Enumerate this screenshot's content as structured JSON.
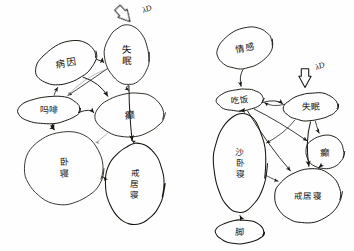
{
  "page": {
    "background_color": "#fefefe",
    "ink_color": "#17150f",
    "faint_ink_color": "#8c8a84",
    "width": 354,
    "height": 251
  },
  "diagrams": [
    {
      "id": "left-diagram",
      "name": "left-network-diagram",
      "node_count": 6,
      "nodes": [
        {
          "id": "L1",
          "name": "node-left-top-left",
          "label": "病因",
          "cx": 66,
          "cy": 63,
          "rx": 31,
          "ry": 20,
          "rotate": -22,
          "font_size": 9.5,
          "stacked": false
        },
        {
          "id": "L2",
          "name": "node-left-top-right",
          "label": "失眠",
          "cx": 127,
          "cy": 55,
          "rx": 22,
          "ry": 30,
          "rotate": -8,
          "font_size": 9.5,
          "stacked": true
        },
        {
          "id": "L3",
          "name": "node-left-middle-left",
          "label": "吗啡",
          "cx": 49,
          "cy": 110,
          "rx": 31,
          "ry": 14,
          "rotate": -3,
          "font_size": 9.0,
          "stacked": false
        },
        {
          "id": "L4",
          "name": "node-left-middle-right",
          "label": "癫",
          "cx": 130,
          "cy": 115,
          "rx": 34,
          "ry": 22,
          "rotate": -4,
          "font_size": 10.0,
          "stacked": false
        },
        {
          "id": "L5",
          "name": "node-left-bottom-left",
          "label": "卧寝",
          "cx": 64,
          "cy": 168,
          "rx": 39,
          "ry": 37,
          "rotate": 0,
          "font_size": 9.0,
          "stacked": true
        },
        {
          "id": "L6",
          "name": "node-left-bottom-right",
          "label": "戒居寝",
          "cx": 135,
          "cy": 184,
          "rx": 29,
          "ry": 41,
          "rotate": 0,
          "font_size": 8.5,
          "stacked": true
        }
      ],
      "annotation": {
        "name": "lambda-d-annotation-left",
        "label": "λD",
        "label_x": 147,
        "label_y": 9,
        "arrow_x": 125,
        "arrow_y": 16,
        "arrow_rotate": -42,
        "font_size": 8
      },
      "edges": [
        {
          "name": "edge-L1-L2",
          "from": "L1",
          "to": "L2",
          "style": "solid"
        },
        {
          "name": "edge-L3-L1",
          "from": "L3",
          "to": "L1",
          "style": "solid"
        },
        {
          "name": "edge-L1-L4",
          "from": "L1",
          "to": "L4",
          "style": "solid"
        },
        {
          "name": "edge-L2-L4",
          "from": "L2",
          "to": "L4",
          "style": "solid"
        },
        {
          "name": "edge-L2-L3",
          "from": "L2",
          "to": "L3",
          "style": "solid"
        },
        {
          "name": "edge-L2-L6",
          "from": "L2",
          "to": "L6",
          "style": "solid"
        },
        {
          "name": "edge-L3-L4",
          "from": "L3",
          "to": "L4",
          "style": "solid"
        },
        {
          "name": "edge-L3-L5a",
          "from": "L3",
          "to": "L5",
          "style": "solid"
        },
        {
          "name": "edge-L3-L5b",
          "from": "L3",
          "to": "L5",
          "style": "solid"
        },
        {
          "name": "edge-L4-L6",
          "from": "L4",
          "to": "L6",
          "style": "solid"
        },
        {
          "name": "edge-L5-L6",
          "from": "L5",
          "to": "L6",
          "style": "solid"
        },
        {
          "name": "edge-L2-L3-faint",
          "from": "L2",
          "to": "L3",
          "style": "faint"
        },
        {
          "name": "edge-L4-L5-faint",
          "from": "L4",
          "to": "L5",
          "style": "faint"
        }
      ]
    },
    {
      "id": "right-diagram",
      "name": "right-network-diagram",
      "node_count": 7,
      "nodes": [
        {
          "id": "R1",
          "name": "node-right-top",
          "label": "情感",
          "cx": 245,
          "cy": 48,
          "rx": 28,
          "ry": 20,
          "rotate": -18,
          "font_size": 9.0,
          "stacked": false
        },
        {
          "id": "R2",
          "name": "node-right-upper-middle",
          "label": "吃饭",
          "cx": 240,
          "cy": 100,
          "rx": 23,
          "ry": 11,
          "rotate": -3,
          "font_size": 8.5,
          "stacked": false
        },
        {
          "id": "R3",
          "name": "node-right-upper-right",
          "label": "失眠",
          "cx": 311,
          "cy": 107,
          "rx": 27,
          "ry": 14,
          "rotate": -5,
          "font_size": 9.0,
          "stacked": false
        },
        {
          "id": "R4",
          "name": "node-right-middle-right",
          "label": "癫",
          "cx": 325,
          "cy": 152,
          "rx": 19,
          "ry": 17,
          "rotate": 0,
          "font_size": 9.5,
          "stacked": false
        },
        {
          "id": "R5",
          "name": "node-right-tall-left",
          "label": "沙卧寝",
          "cx": 240,
          "cy": 163,
          "rx": 26,
          "ry": 50,
          "rotate": 0,
          "font_size": 8.5,
          "stacked": true
        },
        {
          "id": "R6",
          "name": "node-right-bottom-right",
          "label": "戒居寝",
          "cx": 308,
          "cy": 196,
          "rx": 33,
          "ry": 27,
          "rotate": -8,
          "font_size": 8.5,
          "stacked": false
        },
        {
          "id": "R7",
          "name": "node-right-bottom-small",
          "label": "脚",
          "cx": 240,
          "cy": 232,
          "rx": 24,
          "ry": 12,
          "rotate": 0,
          "font_size": 9.0,
          "stacked": false
        }
      ],
      "annotation": {
        "name": "lambda-d-annotation-right",
        "label": "λD",
        "label_x": 320,
        "label_y": 66,
        "arrow_x": 305,
        "arrow_y": 80,
        "arrow_rotate": 0,
        "font_size": 8
      },
      "edges": [
        {
          "name": "edge-R1-R2",
          "from": "R1",
          "to": "R2",
          "style": "solid"
        },
        {
          "name": "edge-R2-R5",
          "from": "R2",
          "to": "R5",
          "style": "solid"
        },
        {
          "name": "edge-R7-R5",
          "from": "R7",
          "to": "R5",
          "style": "solid"
        },
        {
          "name": "edge-R3-R2",
          "from": "R3",
          "to": "R2",
          "style": "solid"
        },
        {
          "name": "edge-R2-R3",
          "from": "R2",
          "to": "R3",
          "style": "solid"
        },
        {
          "name": "edge-R2-R4",
          "from": "R2",
          "to": "R4",
          "style": "solid"
        },
        {
          "name": "edge-R2-R6",
          "from": "R2",
          "to": "R6",
          "style": "solid"
        },
        {
          "name": "edge-R3-R5",
          "from": "R3",
          "to": "R5",
          "style": "solid"
        },
        {
          "name": "edge-R3-R4",
          "from": "R3",
          "to": "R4",
          "style": "solid"
        },
        {
          "name": "edge-R3-R6",
          "from": "R3",
          "to": "R6",
          "style": "solid"
        },
        {
          "name": "edge-R4-R6",
          "from": "R4",
          "to": "R6",
          "style": "solid"
        },
        {
          "name": "edge-R5-R6",
          "from": "R5",
          "to": "R6",
          "style": "solid"
        }
      ]
    }
  ]
}
